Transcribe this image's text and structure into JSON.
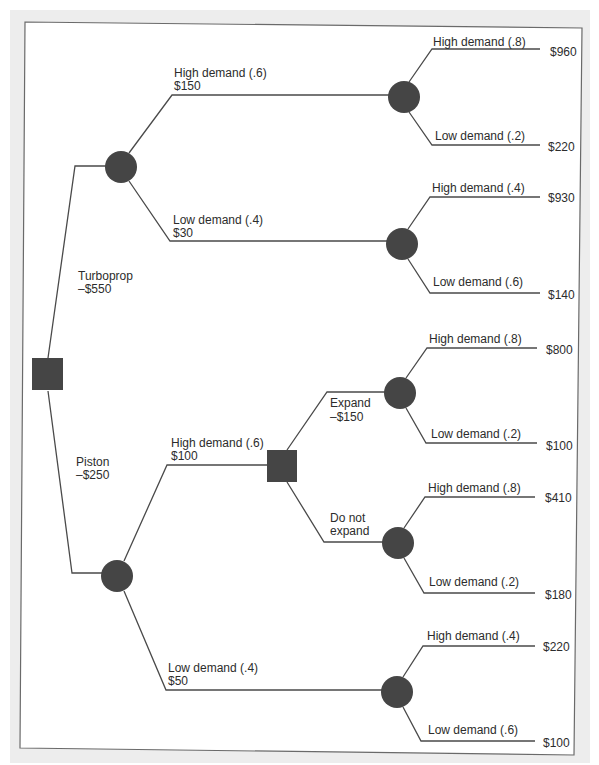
{
  "colors": {
    "node_fill": "#454545",
    "edge": "#4a4a4a",
    "text": "#2c2c2c",
    "margin": "#ededed",
    "frame": "#6a6a6a"
  },
  "tree": {
    "root": {
      "type": "decision"
    },
    "turboprop": {
      "label": "Turboprop",
      "cost": "–$550",
      "node": "chance",
      "high": {
        "label": "High demand (.6)",
        "payoff": "$150",
        "node": "chance",
        "high": {
          "label": "High demand (.8)",
          "value": "$960"
        },
        "low": {
          "label": "Low demand (.2)",
          "value": "$220"
        }
      },
      "low": {
        "label": "Low demand (.4)",
        "payoff": "$30",
        "node": "chance",
        "high": {
          "label": "High demand (.4)",
          "value": "$930"
        },
        "low": {
          "label": "Low demand (.6)",
          "value": "$140"
        }
      }
    },
    "piston": {
      "label": "Piston",
      "cost": "–$250",
      "node": "chance",
      "high": {
        "label": "High demand (.6)",
        "payoff": "$100",
        "node": "decision",
        "expand": {
          "label": "Expand",
          "cost": "–$150",
          "node": "chance",
          "high": {
            "label": "High demand (.8)",
            "value": "$800"
          },
          "low": {
            "label": "Low demand (.2)",
            "value": "$100"
          }
        },
        "no_expand": {
          "label_line1": "Do not",
          "label_line2": "expand",
          "node": "chance",
          "high": {
            "label": "High demand (.8)",
            "value": "$410"
          },
          "low": {
            "label": "Low demand (.2)",
            "value": "$180"
          }
        }
      },
      "low": {
        "label": "Low demand (.4)",
        "payoff": "$50",
        "node": "chance",
        "high": {
          "label": "High demand (.4)",
          "value": "$220"
        },
        "low": {
          "label": "Low demand (.6)",
          "value": "$100"
        }
      }
    }
  }
}
